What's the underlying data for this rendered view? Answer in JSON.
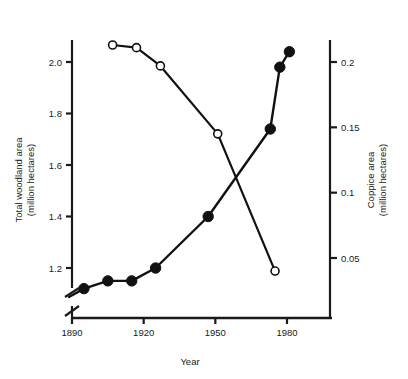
{
  "chart_data": {
    "type": "line",
    "title": "",
    "xlabel": "Year",
    "ylabel": "Total woodland area\n(million hectares)",
    "y2label": "Coppice area\n(million hectares)",
    "xlim": [
      1888,
      1992
    ],
    "ylim": [
      1.08,
      2.09
    ],
    "y2lim": [
      0.028,
      0.215
    ],
    "grid": false,
    "legend": "none",
    "axis_break_left": true,
    "xticks": [
      1890,
      1920,
      1950,
      1980
    ],
    "xtick_labels": [
      "1890",
      "1920",
      "1950",
      "1980"
    ],
    "yticks": [
      1.2,
      1.4,
      1.6,
      1.8,
      2.0
    ],
    "ytick_labels": [
      "1.2",
      "1.4",
      "1.6",
      "1.8",
      "2.0"
    ],
    "y2ticks": [
      0.05,
      0.1,
      0.15,
      0.2
    ],
    "y2tick_labels": [
      "0.05",
      "0.1",
      "0.15",
      "0.2"
    ],
    "series": [
      {
        "name": "Total woodland area",
        "axis": "left",
        "marker": "filled-circle",
        "marker_size": 5.2,
        "line_width": 2.4,
        "color": "#111111",
        "x": [
          1895,
          1905,
          1915,
          1925,
          1947,
          1973,
          1977,
          1981
        ],
        "values": [
          1.12,
          1.15,
          1.15,
          1.2,
          1.4,
          1.74,
          1.98,
          2.04
        ]
      },
      {
        "name": "Coppice area",
        "axis": "right",
        "marker": "open-circle",
        "marker_size": 4.0,
        "line_width": 2.2,
        "color": "#111111",
        "x": [
          1907,
          1917,
          1927,
          1951,
          1975
        ],
        "values": [
          0.213,
          0.211,
          0.197,
          0.145,
          0.04
        ]
      }
    ]
  },
  "axes": {
    "left_title_line1": "Total woodland area",
    "left_title_line2": "(million hectares)",
    "right_title_line1": "Coppice area",
    "right_title_line2": "(million hectares)",
    "x_title": "Year"
  }
}
